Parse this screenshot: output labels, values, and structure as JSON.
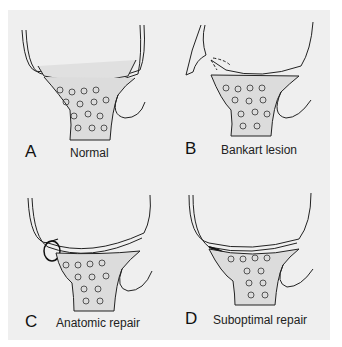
{
  "figure": {
    "panels": [
      {
        "letter": "A",
        "caption": "Normal"
      },
      {
        "letter": "B",
        "caption": "Bankart lesion"
      },
      {
        "letter": "C",
        "caption": "Anatomic repair"
      },
      {
        "letter": "D",
        "caption": "Suboptimal repair"
      }
    ],
    "colors": {
      "background": "#efefef",
      "line": "#222222",
      "bone_fill": "#dcdcdc"
    }
  }
}
